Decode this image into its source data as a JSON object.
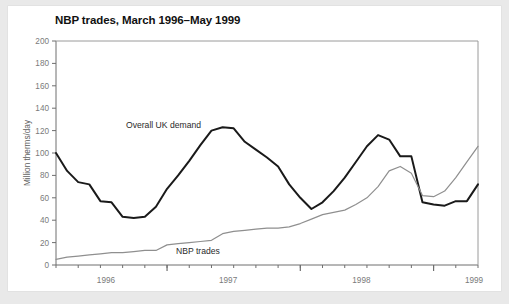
{
  "chart_data": {
    "type": "line",
    "title": "NBP trades, March 1996–May 1999",
    "xlabel": "",
    "ylabel": "Million therms/day",
    "ylim": [
      0,
      200
    ],
    "ytick_labels": [
      "0",
      "20",
      "40",
      "60",
      "80",
      "100",
      "120",
      "140",
      "160",
      "180",
      "200"
    ],
    "ytick_values": [
      0,
      20,
      40,
      60,
      80,
      100,
      120,
      140,
      160,
      180,
      200
    ],
    "xtick_labels": [
      "1996",
      "1997",
      "1998",
      "1999"
    ],
    "xtick_values": [
      1996,
      1997,
      1998,
      1999
    ],
    "x_minor_tick_interval_months": 2,
    "grid": false,
    "legend": "inline annotations",
    "x": [
      "1996-03",
      "1996-04",
      "1996-05",
      "1996-06",
      "1996-07",
      "1996-08",
      "1996-09",
      "1996-10",
      "1996-11",
      "1996-12",
      "1997-01",
      "1997-02",
      "1997-03",
      "1997-04",
      "1997-05",
      "1997-06",
      "1997-07",
      "1997-08",
      "1997-09",
      "1997-10",
      "1997-11",
      "1997-12",
      "1998-01",
      "1998-02",
      "1998-03",
      "1998-04",
      "1998-05",
      "1998-06",
      "1998-07",
      "1998-08",
      "1998-09",
      "1998-10",
      "1998-11",
      "1998-12",
      "1999-01",
      "1999-02",
      "1999-03",
      "1999-04",
      "1999-05"
    ],
    "series": [
      {
        "name": "Overall UK demand",
        "color": "#1a1a1a",
        "width": 2.0,
        "label_x_index": 9,
        "values": [
          100,
          84,
          74,
          72,
          57,
          56,
          43,
          42,
          43,
          52,
          68,
          80,
          93,
          107,
          120,
          123,
          122,
          110,
          103,
          96,
          88,
          72,
          60,
          50,
          56,
          66,
          78,
          92,
          106,
          116,
          112,
          97,
          97,
          56,
          54,
          53,
          57,
          57,
          72
        ]
      },
      {
        "name": "NBP trades",
        "color": "#8f8f8f",
        "width": 1.2,
        "label_x_index": 21,
        "values": [
          5,
          7,
          8,
          9,
          10,
          11,
          11,
          12,
          13,
          13,
          18,
          19,
          20,
          21,
          22,
          28,
          30,
          31,
          32,
          33,
          33,
          34,
          37,
          41,
          45,
          47,
          49,
          54,
          60,
          70,
          84,
          88,
          82,
          62,
          61,
          66,
          78,
          92,
          106
        ]
      }
    ],
    "annotations": [
      {
        "text": "Overall UK demand",
        "x": 118,
        "y": 122
      },
      {
        "text": "NBP trades",
        "x": 168,
        "y": 248
      }
    ]
  },
  "style": {
    "page_background": "#e9e9e9",
    "card_background": "#ffffff",
    "axis_color": "#6e6e6e",
    "title_color": "#111111",
    "tick_label_color": "#7a7a7a"
  }
}
